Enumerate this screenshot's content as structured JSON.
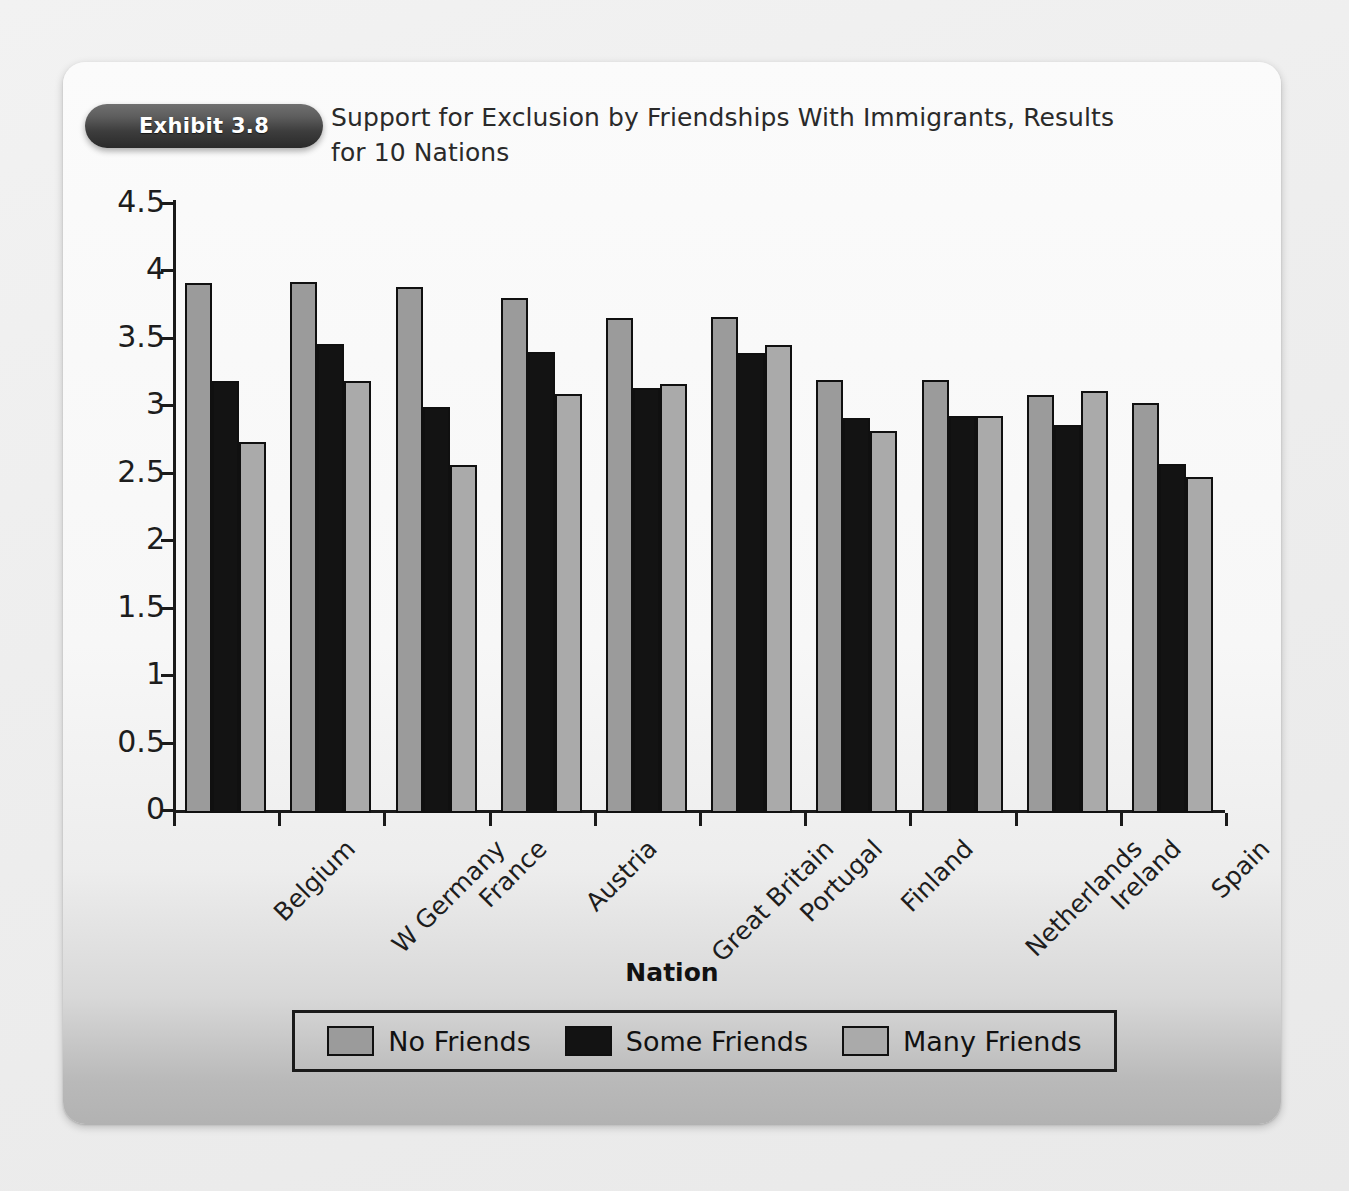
{
  "exhibit": {
    "badge_label": "Exhibit 3.8",
    "title": "Support for Exclusion by Friendships With Immigrants, Results for 10 Nations"
  },
  "chart_data": {
    "type": "bar",
    "title": "Support for Exclusion by Friendships With Immigrants, Results for 10 Nations",
    "xlabel": "Nation",
    "ylabel": "",
    "ylim": [
      0,
      4.5
    ],
    "yticks": [
      "0",
      "0.5",
      "1",
      "1.5",
      "2",
      "2.5",
      "3",
      "3.5",
      "4",
      "4.5"
    ],
    "ytick_values": [
      0,
      0.5,
      1,
      1.5,
      2,
      2.5,
      3,
      3.5,
      4,
      4.5
    ],
    "grid": false,
    "legend_position": "bottom",
    "categories": [
      "Belgium",
      "W Germany",
      "France",
      "Austria",
      "Great Britain",
      "Portugal",
      "Finland",
      "Netherlands",
      "Ireland",
      "Spain"
    ],
    "series": [
      {
        "name": "No Friends",
        "color": "#9b9b9b",
        "values": [
          3.93,
          3.94,
          3.9,
          3.82,
          3.67,
          3.68,
          3.21,
          3.21,
          3.1,
          3.04
        ]
      },
      {
        "name": "Some Friends",
        "color": "#131313",
        "values": [
          3.2,
          3.48,
          3.01,
          3.42,
          3.15,
          3.41,
          2.93,
          2.94,
          2.88,
          2.59
        ]
      },
      {
        "name": "Many Friends",
        "color": "#aaaaaa",
        "values": [
          2.75,
          3.2,
          2.58,
          3.11,
          3.18,
          3.47,
          2.83,
          2.94,
          3.13,
          2.49
        ]
      }
    ]
  }
}
